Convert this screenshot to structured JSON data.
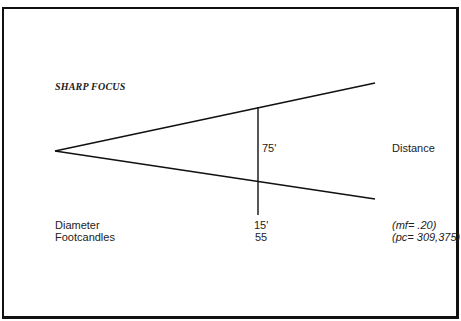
{
  "diagram": {
    "title": "SHARP FOCUS",
    "beam_height_label": "75'",
    "distance_label": "Distance",
    "rows": [
      {
        "label": "Diameter",
        "value": "15'"
      },
      {
        "label": "Footcandles",
        "value": "55"
      }
    ],
    "params": {
      "mf": "(mf= .20)",
      "pc": "(pc= 309,375)"
    }
  }
}
